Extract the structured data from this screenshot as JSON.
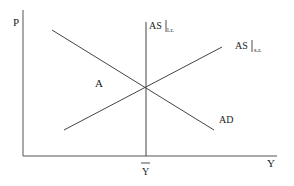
{
  "diagram": {
    "axes": {
      "y_label": "P",
      "x_label": "Y"
    },
    "curves": {
      "ad": {
        "label": "AD"
      },
      "as_sr": {
        "label": "AS",
        "subscript": "s.r."
      },
      "as_lr": {
        "label": "AS",
        "subscript": "l.r."
      }
    },
    "point_label": "A",
    "x_tick_label": "Y"
  },
  "colors": {
    "line": "#444444",
    "axis": "#555555",
    "text": "#222222"
  }
}
